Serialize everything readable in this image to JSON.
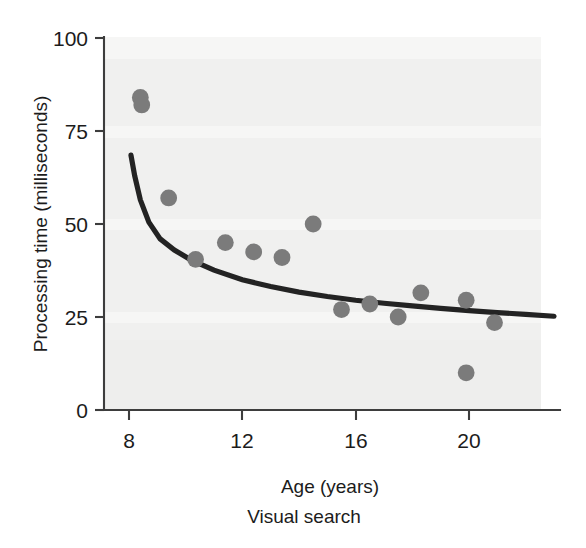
{
  "figure": {
    "caption": "Visual search",
    "background_color": "#f0f0ef",
    "dot_color": "#7b7b7b",
    "curve_color": "#232323",
    "axis_color": "#3d3d3d"
  },
  "chart_data": {
    "type": "scatter",
    "title": "",
    "subtitle": "Visual search",
    "xlabel": "Age (years)",
    "ylabel": "Processing time (milliseconds)",
    "xlim": [
      7.6,
      23.2
    ],
    "ylim": [
      0,
      100
    ],
    "xticks": [
      8,
      12,
      16,
      20
    ],
    "xtick_labels": [
      "8",
      "12",
      "16",
      "20"
    ],
    "yticks": [
      0,
      25,
      50,
      75,
      100
    ],
    "ytick_labels": [
      "0",
      "25",
      "50",
      "75",
      "100"
    ],
    "grid": false,
    "legend": null,
    "series": [
      {
        "name": "Participants",
        "marker": "circle",
        "color": "#7b7b7b",
        "x": [
          8.4,
          8.45,
          9.4,
          10.35,
          11.4,
          12.4,
          13.4,
          14.5,
          15.5,
          16.5,
          17.5,
          18.3,
          19.9,
          19.9,
          20.9
        ],
        "y": [
          84,
          82,
          57,
          40.5,
          45,
          42.5,
          41,
          50,
          27,
          28.5,
          25,
          31.5,
          29.5,
          10,
          23.5
        ]
      },
      {
        "name": "Fitted curve",
        "type": "line",
        "color": "#232323",
        "x": [
          8.07,
          8.2,
          8.4,
          8.7,
          9.1,
          9.6,
          10.2,
          11.0,
          12.0,
          13.0,
          14.0,
          15.0,
          16.0,
          17.0,
          18.0,
          19.0,
          20.0,
          21.0,
          22.0,
          23.0
        ],
        "y": [
          68.5,
          63.0,
          56.5,
          50.5,
          46.0,
          43.0,
          40.3,
          37.6,
          35.0,
          33.2,
          31.7,
          30.5,
          29.5,
          28.7,
          28.0,
          27.3,
          26.7,
          26.2,
          25.7,
          25.2
        ]
      }
    ]
  }
}
